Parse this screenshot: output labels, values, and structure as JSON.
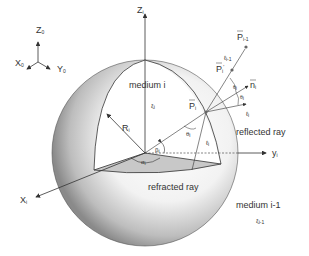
{
  "diagram": {
    "global_axes": {
      "z": "Z",
      "x": "X",
      "y": "Y",
      "subscript": "0"
    },
    "local_axes": {
      "z": "Z",
      "x": "X",
      "y": "y",
      "subscript": "i"
    },
    "labels": {
      "medium_i": "medium i",
      "xi_i": "ξ",
      "xi_i_sub": "i",
      "medium_i_minus_1": "medium i-1",
      "xi_i_minus_1": "ξ",
      "xi_i_minus_1_sub": "i-1",
      "radius": "R",
      "radius_sub": "i",
      "alpha": "α",
      "alpha_sub": "i",
      "beta": "β",
      "beta_sub": "i",
      "theta": "θ",
      "theta_sub": "i",
      "point_P": "P",
      "point_P_sub": "i",
      "point_P_prime": "P",
      "point_P_prime_sub": "i",
      "point_P_prev": "P",
      "point_P_prev_sub": "i-1",
      "normal": "n",
      "normal_sub": "i",
      "ell": "ℓ",
      "ell_sub": "i",
      "ell_prev": "ℓ",
      "ell_prev_sub": "i-1",
      "reflected_ray": "reflected ray",
      "refracted_ray": "refracted ray"
    },
    "colors": {
      "line": "#333333",
      "sphere_light": "#ffffff",
      "sphere_dark": "#8a8a8a",
      "wedge_fill": "#c8c8c8",
      "point": "#666666"
    }
  }
}
